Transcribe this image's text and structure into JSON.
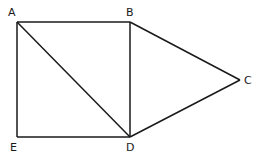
{
  "diagram": {
    "points": {
      "A": {
        "label": "A",
        "x": 17,
        "y": 22,
        "lx": 8,
        "ly": 16
      },
      "B": {
        "label": "B",
        "x": 130,
        "y": 22,
        "lx": 126,
        "ly": 16
      },
      "C": {
        "label": "C",
        "x": 240,
        "y": 80,
        "lx": 244,
        "ly": 84
      },
      "D": {
        "label": "D",
        "x": 130,
        "y": 137,
        "lx": 126,
        "ly": 151
      },
      "E": {
        "label": "E",
        "x": 17,
        "y": 137,
        "lx": 10,
        "ly": 151
      }
    },
    "segments": [
      [
        "A",
        "B"
      ],
      [
        "B",
        "D"
      ],
      [
        "D",
        "E"
      ],
      [
        "E",
        "A"
      ],
      [
        "A",
        "D"
      ],
      [
        "B",
        "C"
      ],
      [
        "C",
        "D"
      ]
    ],
    "stroke_color": "#1a1a1a"
  }
}
